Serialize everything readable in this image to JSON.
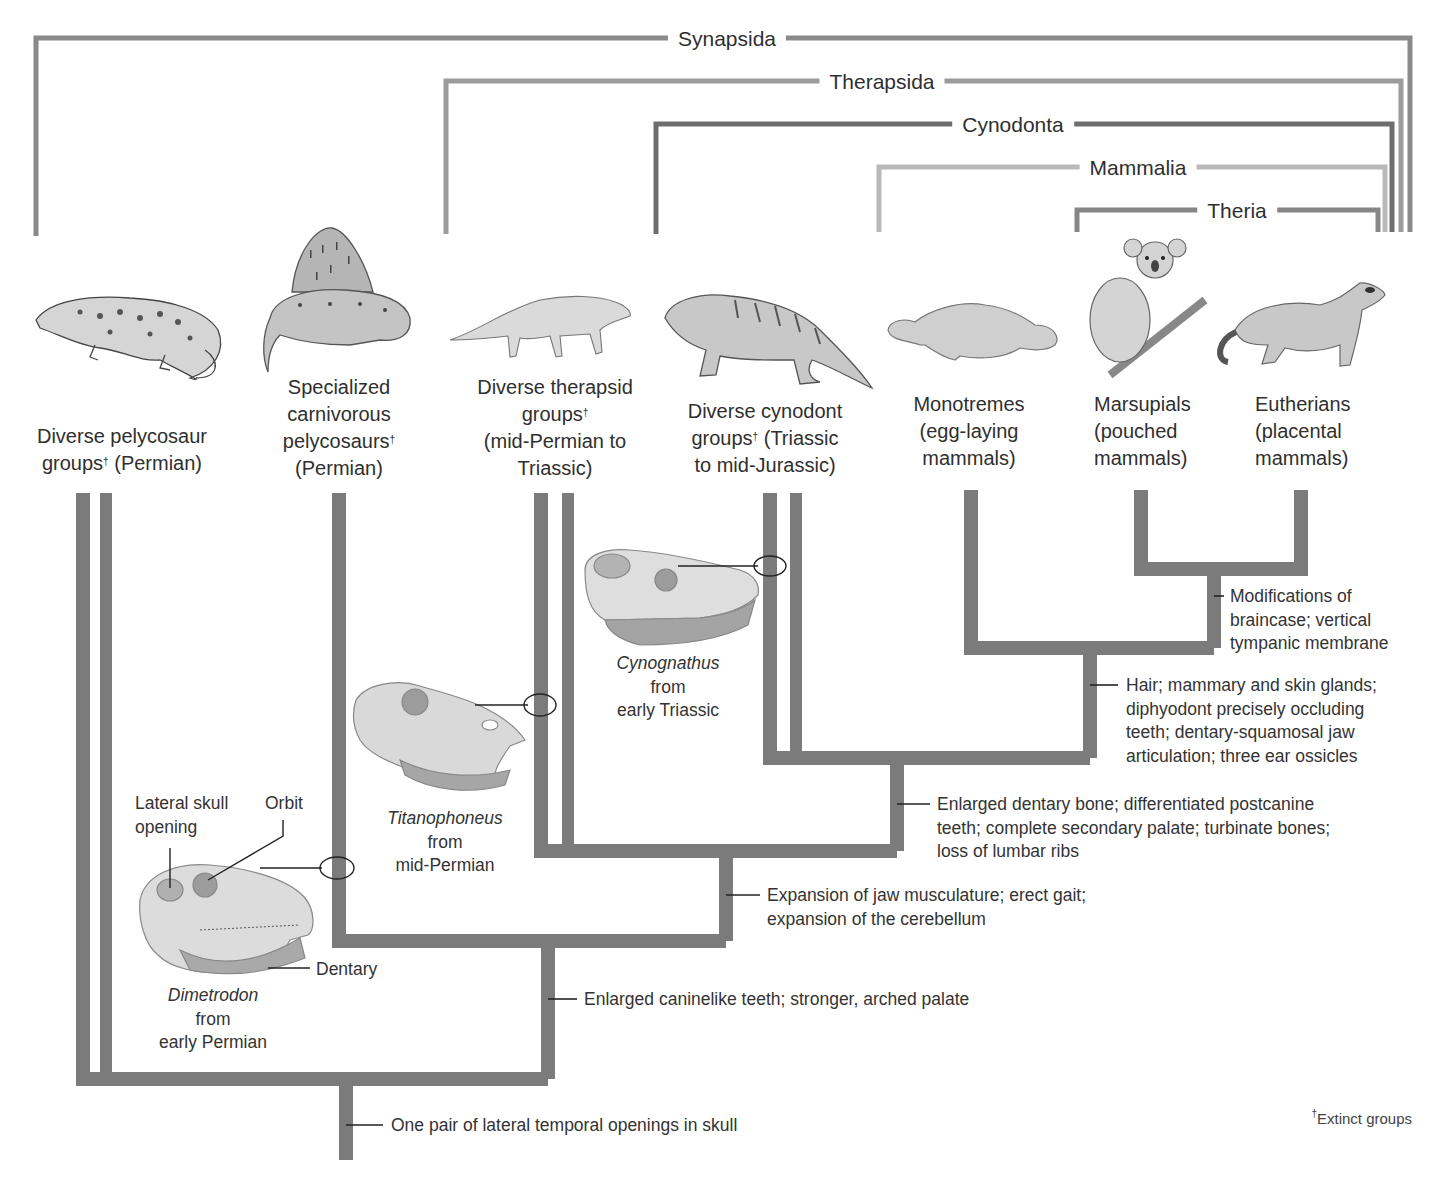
{
  "colors": {
    "tree_dark": "#7a7a7a",
    "clade_synapsida": "#8a8a8a",
    "clade_therapsida": "#9a9a9a",
    "clade_cynodonta": "#6e6e6e",
    "clade_mammalia": "#b8b8b8",
    "clade_theria": "#868686",
    "text": "#2f2f2f"
  },
  "clades": [
    {
      "name": "Synapsida"
    },
    {
      "name": "Therapsida"
    },
    {
      "name": "Cynodonta"
    },
    {
      "name": "Mammalia"
    },
    {
      "name": "Theria"
    }
  ],
  "taxa": [
    {
      "icon": "pelycosaur-illustration",
      "line1": "",
      "line2": "Diverse pelycosaur",
      "line3": "groups",
      "line3_sup": "†",
      "line3_tail": " (Permian)"
    },
    {
      "icon": "dimetrodon-illustration",
      "line1": "Specialized",
      "line2": "carnivorous",
      "line3": "pelycosaurs",
      "line3_sup": "†",
      "line4": "(Permian)"
    },
    {
      "icon": "therapsid-illustration",
      "line1": "Diverse therapsid",
      "line2": "groups",
      "line2_sup": "†",
      "line3": "(mid-Permian to",
      "line4": "Triassic)"
    },
    {
      "icon": "cynodont-illustration",
      "line1": "Diverse cynodont",
      "line2": "groups",
      "line2_sup": "†",
      "line2_tail": " (Triassic",
      "line3": "to mid-Jurassic)"
    },
    {
      "icon": "platypus-illustration",
      "line1": "Monotremes",
      "line2": "(egg-laying",
      "line3": "mammals)"
    },
    {
      "icon": "koala-illustration",
      "line1": "Marsupials",
      "line2": "(pouched",
      "line3": "mammals)"
    },
    {
      "icon": "ferret-illustration",
      "line1": "Eutherians",
      "line2": "(placental",
      "line3": "mammals)"
    }
  ],
  "traits": [
    {
      "lines": [
        "One pair of lateral temporal openings in skull"
      ]
    },
    {
      "lines": [
        "Enlarged caninelike teeth; stronger, arched palate"
      ]
    },
    {
      "lines": [
        "Expansion of jaw musculature; erect gait;",
        "expansion of the cerebellum"
      ]
    },
    {
      "lines": [
        "Enlarged dentary bone; differentiated postcanine",
        "teeth; complete secondary palate; turbinate bones;",
        "loss of lumbar ribs"
      ]
    },
    {
      "lines": [
        "Hair; mammary and skin glands;",
        "diphyodont precisely occluding",
        "teeth; dentary-squamosal jaw",
        "articulation; three ear ossicles"
      ]
    },
    {
      "lines": [
        "Modifications of",
        "braincase; vertical",
        "tympanic membrane"
      ]
    }
  ],
  "skulls": [
    {
      "genus": "Dimetrodon",
      "line2": "from",
      "line3": "early Permian",
      "annotations": {
        "lateral_opening_1": "Lateral skull",
        "lateral_opening_2": "opening",
        "orbit": "Orbit",
        "dentary": "Dentary"
      }
    },
    {
      "genus": "Titanophoneus",
      "line2": "from",
      "line3": "mid-Permian"
    },
    {
      "genus": "Cynognathus",
      "line2": "from",
      "line3": "early Triassic"
    }
  ],
  "footnote": {
    "symbol": "†",
    "text": "Extinct groups"
  }
}
